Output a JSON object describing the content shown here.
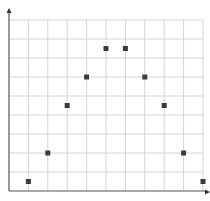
{
  "chart_data": {
    "type": "scatter",
    "title": "",
    "xlabel": "",
    "ylabel": "",
    "x": [
      1,
      2,
      3,
      4,
      5,
      6,
      7,
      8,
      9,
      10
    ],
    "y": [
      0.5,
      2,
      4.5,
      6,
      7.5,
      7.5,
      6,
      4.5,
      2,
      0.5
    ],
    "series": [
      {
        "name": "points",
        "marker": "square",
        "color": "#3a3a3a",
        "values": [
          0.5,
          2,
          4.5,
          6,
          7.5,
          7.5,
          6,
          4.5,
          2,
          0.5
        ]
      }
    ],
    "xlim": [
      0,
      10
    ],
    "ylim": [
      0,
      9
    ],
    "grid": true,
    "grid_columns": 10,
    "grid_rows": 9,
    "tick_labels": false,
    "legend": null,
    "axes_arrows": true
  },
  "style": {
    "grid_color": "#d4d4d4",
    "axis_color": "#555555",
    "marker_color": "#3a3a3a",
    "background": "#ffffff"
  }
}
